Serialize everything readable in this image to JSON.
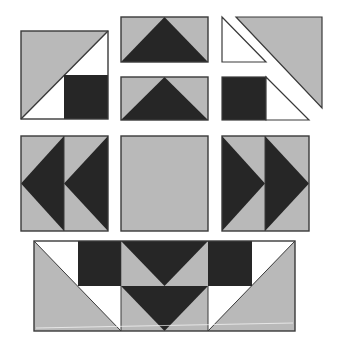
{
  "diagram": {
    "colors": {
      "light": "#b9b9b9",
      "dark": "#262626",
      "background": "#ffffff",
      "outline": "#3a3a3a"
    },
    "units": [
      {
        "name": "corner-unit-top-left",
        "description": "Large half-square triangle with dark square and white triangles"
      },
      {
        "name": "flying-goose-upper",
        "description": "Flying geese unit, dark point up"
      },
      {
        "name": "flying-goose-lower",
        "description": "Flying geese unit, dark point up"
      },
      {
        "name": "corner-pieces-top-right",
        "description": "Separated white triangle, gray triangle, dark square and white triangle"
      },
      {
        "name": "geese-pair-left",
        "description": "Two flying geese pointing left"
      },
      {
        "name": "center-square",
        "description": "Plain light gray square"
      },
      {
        "name": "geese-pair-right",
        "description": "Two flying geese pointing right"
      },
      {
        "name": "bottom-border-strip",
        "description": "Assembled strip of corner units and flying geese"
      }
    ]
  }
}
